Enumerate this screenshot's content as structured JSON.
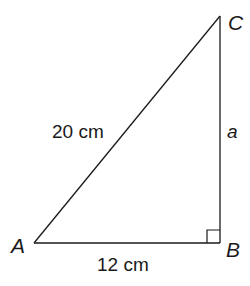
{
  "diagram": {
    "type": "right-triangle",
    "vertices": {
      "A": {
        "label": "A",
        "x": 34,
        "y": 243
      },
      "B": {
        "label": "B",
        "x": 220,
        "y": 243
      },
      "C": {
        "label": "C",
        "x": 220,
        "y": 16
      }
    },
    "right_angle_at": "B",
    "sides": {
      "AC": {
        "label": "20 cm",
        "role": "hypotenuse"
      },
      "AB": {
        "label": "12 cm",
        "role": "base"
      },
      "BC": {
        "label": "a",
        "role": "unknown side"
      }
    },
    "colors": {
      "stroke": "#1a1a1a",
      "background": "#ffffff"
    }
  }
}
